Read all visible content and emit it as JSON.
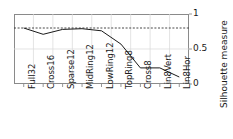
{
  "chart_data": {
    "type": "line",
    "title": "",
    "xlabel": "",
    "ylabel": "Silhouette measure",
    "categories": [
      "Full32",
      "Cross16",
      "Sparse12",
      "MidRing12",
      "LowRing12",
      "TopRing8",
      "Cross8",
      "Lin8Vert",
      "Lin8Hor"
    ],
    "values": [
      0.8,
      0.71,
      0.78,
      0.79,
      0.76,
      0.57,
      0.23,
      0.23,
      0.1
    ],
    "ylim": [
      0,
      1
    ],
    "yticks": [
      "0",
      "0.5",
      "1"
    ],
    "ytick_values": [
      0,
      0.5,
      1
    ],
    "grid": true,
    "legend": "none",
    "annotations": [
      {
        "name": "reference-line",
        "type": "horizontal-dashed",
        "value": 0.8
      }
    ],
    "series": [
      {
        "name": "silhouette",
        "color": "#1a1a1a",
        "values": [
          0.8,
          0.71,
          0.78,
          0.79,
          0.76,
          0.57,
          0.23,
          0.23,
          0.1
        ]
      }
    ]
  },
  "colors": {
    "line": "#1a1a1a",
    "grid": "#d8d8d8",
    "frame": "#8a8a8a",
    "reference": "#333333",
    "background": "#ffffff",
    "text": "#1a1a1a"
  }
}
